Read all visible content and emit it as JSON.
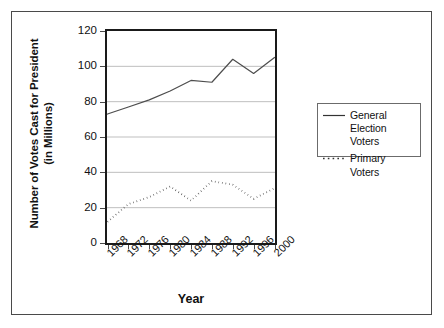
{
  "chart_data": {
    "type": "line",
    "title": "",
    "xlabel": "Year",
    "ylabel": "Number of Votes Cast for President (in Millions)",
    "ylabel_line1": "Number of Votes Cast for President",
    "ylabel_line2": "(in Millions)",
    "categories": [
      "1968",
      "1972",
      "1976",
      "1980",
      "1984",
      "1988",
      "1992",
      "1996",
      "2000"
    ],
    "x": [
      1968,
      1972,
      1976,
      1980,
      1984,
      1988,
      1992,
      1996,
      2000
    ],
    "xlim": [
      1968,
      2000
    ],
    "ylim": [
      0,
      120
    ],
    "yticks": [
      0,
      20,
      40,
      60,
      80,
      100,
      120
    ],
    "ytick_labels": [
      "0",
      "20",
      "40",
      "60",
      "80",
      "100",
      "120"
    ],
    "grid": true,
    "grid_axis": "y",
    "legend_position": "right",
    "series": [
      {
        "name": "General Election Voters",
        "legend_label_line1": "General Election",
        "legend_label_line2": "Voters",
        "style": "solid",
        "color": "#4d4d4d",
        "values": [
          73,
          77,
          81,
          86,
          92,
          91,
          104,
          96,
          105
        ]
      },
      {
        "name": "Primary Voters",
        "legend_label_line1": "Primary Voters",
        "legend_label_line2": "",
        "style": "dotted",
        "color": "#4d4d4d",
        "values": [
          12,
          22,
          26,
          32,
          24,
          35,
          33,
          25,
          31
        ]
      }
    ]
  },
  "legend": {
    "items": [
      {
        "label_line1": "General Election",
        "label_line2": "Voters",
        "icon": "solid-line-icon"
      },
      {
        "label_line1": "Primary Voters",
        "label_line2": "",
        "icon": "dotted-line-icon"
      }
    ]
  },
  "colors": {
    "line": "#4d4d4d",
    "grid": "#bfbfbf",
    "axis": "#1a1a1a",
    "frame": "#4a4a4a",
    "text": "#111111",
    "background": "#ffffff"
  }
}
